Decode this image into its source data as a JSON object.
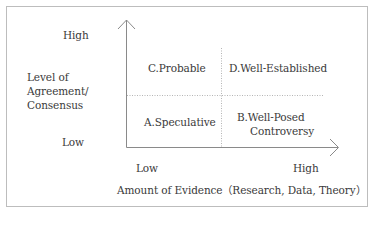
{
  "diagram": {
    "type": "quadrant",
    "y_axis": {
      "title_lines": [
        "Level of",
        "Agreement/",
        "Consensus"
      ],
      "high_label": "High",
      "low_label": "Low"
    },
    "x_axis": {
      "title": "Amount of Evidence（Research, Data, Theory）",
      "low_label": "Low",
      "high_label": "High"
    },
    "quadrants": {
      "top_left": {
        "label": "C.Probable"
      },
      "top_right": {
        "label": "D.Well-Established"
      },
      "bottom_left": {
        "label": "A.Speculative"
      },
      "bottom_right": {
        "label_lines": [
          "B.Well-Posed",
          "Controversy"
        ]
      }
    },
    "colors": {
      "axis": "#8a8a8a",
      "divider": "#b5b5b5",
      "border": "#bdbdbd",
      "text": "#3a3a3a"
    }
  }
}
